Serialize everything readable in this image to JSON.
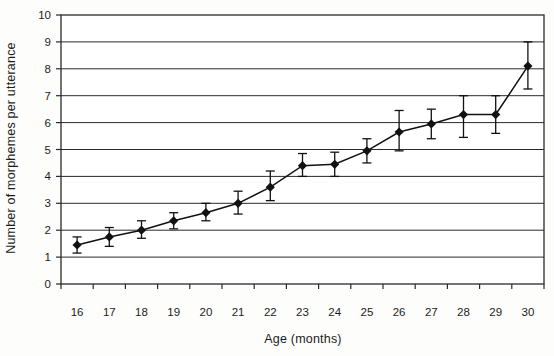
{
  "figure": {
    "background": "#fdfdfb",
    "line_color": "#111111",
    "marker_color": "#111111",
    "grid_color": "#2a2a2a",
    "text_color": "#1c1c1c"
  },
  "chart_data": {
    "type": "line",
    "title": "",
    "xlabel": "Age (months)",
    "ylabel": "Number of morphemes per utterance",
    "x": [
      16,
      17,
      18,
      19,
      20,
      21,
      22,
      23,
      24,
      25,
      26,
      27,
      28,
      29,
      30
    ],
    "values": [
      1.45,
      1.75,
      2.0,
      2.35,
      2.65,
      3.0,
      3.6,
      4.4,
      4.45,
      4.95,
      5.65,
      5.95,
      6.3,
      6.3,
      8.1
    ],
    "error_bars": {
      "low": [
        1.15,
        1.4,
        1.7,
        2.05,
        2.35,
        2.6,
        3.1,
        4.0,
        4.0,
        4.5,
        4.95,
        5.4,
        5.45,
        5.6,
        7.25
      ],
      "high": [
        1.75,
        2.1,
        2.35,
        2.65,
        3.0,
        3.45,
        4.2,
        4.85,
        4.9,
        5.4,
        6.45,
        6.5,
        7.0,
        7.0,
        9.0
      ]
    },
    "ylim": [
      0,
      10
    ],
    "ytick_step": 1,
    "ytick_labels": [
      "0",
      "1",
      "2",
      "3",
      "4",
      "5",
      "6",
      "7",
      "8",
      "9",
      "10"
    ],
    "xtick_labels": [
      "16",
      "17",
      "18",
      "19",
      "20",
      "21",
      "22",
      "23",
      "24",
      "25",
      "26",
      "27",
      "28",
      "29",
      "30"
    ],
    "grid": "horizontal",
    "legend": "none",
    "marker": "diamond",
    "plot_border": true
  }
}
